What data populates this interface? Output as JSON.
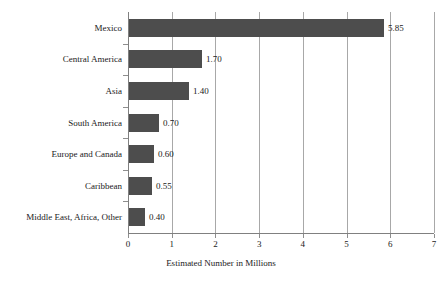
{
  "chart_data": {
    "type": "bar",
    "orientation": "horizontal",
    "title": "",
    "xlabel": "Estimated Number in Millions",
    "ylabel": "",
    "categories": [
      "Mexico",
      "Central America",
      "Asia",
      "South America",
      "Europe and Canada",
      "Caribbean",
      "Middle East, Africa, Other"
    ],
    "values": [
      5.85,
      1.7,
      1.4,
      0.7,
      0.6,
      0.55,
      0.4
    ],
    "value_labels": [
      "5.85",
      "1.70",
      "1.40",
      "0.70",
      "0.60",
      "0.55",
      "0.40"
    ],
    "xlim": [
      0,
      7
    ],
    "xticks": [
      0,
      1,
      2,
      3,
      4,
      5,
      6,
      7
    ],
    "xtick_labels": [
      "0",
      "1",
      "2",
      "3",
      "4",
      "5",
      "6",
      "7"
    ],
    "grid": "vertical",
    "legend": "none",
    "bar_color": "#4d4d4d",
    "gridline_color": "#a8a8a8",
    "axis_color": "#808080",
    "background": "#ffffff",
    "text_color": "#1a1a1a"
  }
}
